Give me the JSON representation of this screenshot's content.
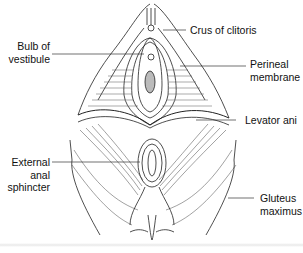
{
  "diagram": {
    "type": "anatomical-illustration",
    "labels": [
      {
        "id": "crus",
        "lines": [
          "Crus of clitoris"
        ]
      },
      {
        "id": "bulb",
        "lines": [
          "Bulb of",
          "vestibule"
        ]
      },
      {
        "id": "perineal",
        "lines": [
          "Perineal",
          "membrane"
        ]
      },
      {
        "id": "levator",
        "lines": [
          "Levator ani"
        ]
      },
      {
        "id": "sphincter",
        "lines": [
          "External",
          "anal",
          "sphincter"
        ]
      },
      {
        "id": "gluteus",
        "lines": [
          "Gluteus",
          "maximus"
        ]
      }
    ]
  }
}
